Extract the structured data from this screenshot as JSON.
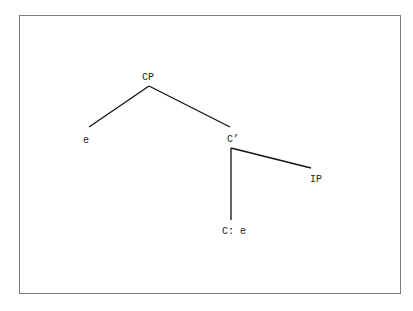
{
  "diagram": {
    "type": "syntax-tree",
    "nodes": [
      {
        "id": "cp",
        "label": "CP",
        "x": 148,
        "y": 78
      },
      {
        "id": "spec",
        "label": "e",
        "x": 86,
        "y": 141
      },
      {
        "id": "cbar",
        "label": "C’",
        "x": 233,
        "y": 140
      },
      {
        "id": "ip",
        "label": "IP",
        "x": 316,
        "y": 180
      },
      {
        "id": "c",
        "label": "C: e",
        "x": 234,
        "y": 232
      }
    ],
    "edges": [
      {
        "from": "cp",
        "to": "spec",
        "x1": 149,
        "y1": 86,
        "x2": 89,
        "y2": 127
      },
      {
        "from": "cp",
        "to": "cbar",
        "x1": 149,
        "y1": 86,
        "x2": 230,
        "y2": 127
      },
      {
        "from": "cbar",
        "to": "ip",
        "x1": 231,
        "y1": 148,
        "x2": 311,
        "y2": 168
      },
      {
        "from": "cbar",
        "to": "c",
        "x1": 231,
        "y1": 148,
        "x2": 231,
        "y2": 220
      }
    ],
    "line_color": "#111111",
    "border_color": "#7a7a7a"
  }
}
